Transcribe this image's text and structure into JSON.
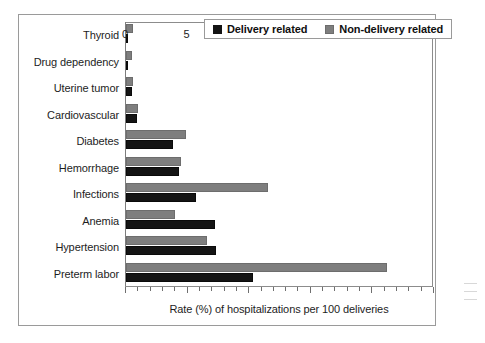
{
  "chart_data": {
    "type": "bar",
    "orientation": "horizontal",
    "title": "",
    "xlabel": "Rate (%) of hospitalizations per 100 deliveries",
    "ylabel": "",
    "xlim": [
      0,
      25
    ],
    "xticks": [
      0,
      5,
      10,
      15,
      20,
      25
    ],
    "xtick_labels": [
      "0",
      "5",
      "10",
      "15",
      "20",
      "25"
    ],
    "minor_tick_step": 1,
    "grid": false,
    "legend_position": "top-right",
    "categories": [
      "Thyroid",
      "Drug dependency",
      "Uterine tumor",
      "Cardiovascular",
      "Diabetes",
      "Hemorrhage",
      "Infections",
      "Anemia",
      "Hypertension",
      "Preterm labor"
    ],
    "series": [
      {
        "name": "Delivery related",
        "color": "#141414",
        "values": [
          0.2,
          0.2,
          0.5,
          0.9,
          3.8,
          4.3,
          5.7,
          7.2,
          7.3,
          10.3
        ]
      },
      {
        "name": "Non-delivery related",
        "color": "#7e7e7e",
        "values": [
          0.6,
          0.5,
          0.6,
          1.0,
          4.9,
          4.5,
          11.5,
          4.0,
          6.6,
          21.2
        ]
      }
    ]
  },
  "legend": {
    "entries": [
      {
        "label": "Delivery related",
        "swatch": "dark"
      },
      {
        "label": "Non-delivery related",
        "swatch": "gray"
      }
    ]
  }
}
